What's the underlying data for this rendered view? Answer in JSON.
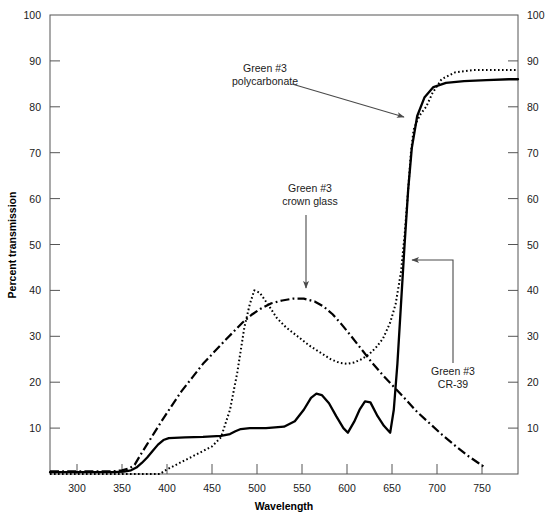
{
  "chart_data": {
    "type": "line",
    "title": "",
    "xlabel": "Wavelength",
    "ylabel": "Percent transmission",
    "xlim": [
      270,
      790
    ],
    "ylim": [
      0,
      100
    ],
    "grid": false,
    "legend_position": "none",
    "x_ticks": [
      300,
      350,
      400,
      450,
      500,
      550,
      600,
      650,
      700,
      750
    ],
    "y_ticks": [
      0,
      10,
      20,
      30,
      40,
      50,
      60,
      70,
      80,
      90,
      100
    ],
    "y_ticks_right": [
      0,
      10,
      20,
      30,
      40,
      50,
      60,
      70,
      80,
      90,
      100
    ],
    "series": [
      {
        "name": "Green #3 polycarbonate",
        "style": "dotted",
        "color": "#000000",
        "x": [
          270,
          330,
          360,
          380,
          392,
          400,
          410,
          420,
          430,
          440,
          450,
          460,
          470,
          478,
          486,
          492,
          497,
          503,
          512,
          522,
          532,
          545,
          558,
          570,
          582,
          592,
          600,
          608,
          616,
          624,
          632,
          640,
          648,
          654,
          660,
          664,
          668,
          671,
          674,
          678,
          682,
          688,
          695,
          705,
          720,
          740,
          760,
          780,
          790
        ],
        "y": [
          0,
          0,
          0,
          0,
          0,
          1,
          2,
          3,
          4,
          5,
          6,
          8,
          14,
          22,
          32,
          37,
          40,
          39.5,
          37,
          34,
          32,
          30,
          28,
          26.5,
          25,
          24.2,
          24,
          24.3,
          25,
          26,
          27.5,
          29.5,
          33,
          37,
          44,
          52,
          62,
          70,
          75,
          77,
          78.5,
          80,
          83,
          86,
          87.5,
          88,
          88,
          88,
          88
        ]
      },
      {
        "name": "Green #3 crown glass",
        "style": "dashdot",
        "color": "#000000",
        "x": [
          270,
          320,
          340,
          350,
          358,
          364,
          370,
          378,
          386,
          394,
          404,
          416,
          428,
          440,
          452,
          464,
          474,
          484,
          494,
          504,
          516,
          528,
          540,
          552,
          564,
          574,
          584,
          594,
          604,
          616,
          628,
          640,
          652,
          664,
          678,
          692,
          706,
          720,
          734,
          746,
          752
        ],
        "y": [
          0.6,
          0.6,
          0.6,
          0.8,
          1.2,
          2,
          4,
          6.5,
          9,
          11.5,
          14.5,
          18,
          21,
          24,
          26.5,
          29,
          31,
          33,
          34.7,
          36,
          37.2,
          37.8,
          38.2,
          38.2,
          37.6,
          36.5,
          34.8,
          32.6,
          30.2,
          27.2,
          24.2,
          21.5,
          19,
          16.5,
          13.5,
          11,
          8.5,
          6.2,
          4,
          2.4,
          1.6
        ]
      },
      {
        "name": "Green #3 CR-39",
        "style": "solid",
        "color": "#000000",
        "x": [
          270,
          340,
          352,
          360,
          366,
          372,
          378,
          384,
          390,
          396,
          402,
          420,
          440,
          460,
          470,
          476,
          482,
          492,
          510,
          530,
          542,
          552,
          560,
          566,
          572,
          580,
          588,
          596,
          601,
          608,
          614,
          620,
          626,
          634,
          641,
          648,
          652,
          656,
          660,
          664,
          668,
          672,
          678,
          686,
          696,
          710,
          730,
          755,
          780,
          790
        ],
        "y": [
          0.4,
          0.4,
          0.5,
          0.8,
          1.4,
          2.4,
          3.6,
          5,
          6.4,
          7.4,
          7.8,
          8,
          8.1,
          8.3,
          8.7,
          9.3,
          9.8,
          10,
          10,
          10.3,
          11.5,
          14,
          16.6,
          17.5,
          17.2,
          15.4,
          12.6,
          10,
          9,
          11.4,
          14,
          15.8,
          15.6,
          12.6,
          10.5,
          9,
          14,
          24,
          37,
          50,
          62,
          71,
          78,
          82,
          84.3,
          85.2,
          85.6,
          85.8,
          86,
          86
        ]
      }
    ],
    "annotations": [
      {
        "id": "polycarbonate",
        "lines": [
          "Green #3",
          "polycarbonate"
        ],
        "text_x": 265,
        "text_y": 72,
        "arrow": {
          "type": "diagonal",
          "x1": 292,
          "y1": 84,
          "x2": 404,
          "y2": 117
        }
      },
      {
        "id": "crown-glass",
        "lines": [
          "Green #3",
          "crown glass"
        ],
        "text_x": 310,
        "text_y": 192,
        "arrow": {
          "type": "vertical",
          "x1": 306,
          "y1": 215,
          "x2": 306,
          "y2": 288
        }
      },
      {
        "id": "cr-39",
        "lines": [
          "Green #3",
          "CR-39"
        ],
        "text_x": 453,
        "text_y": 375,
        "arrow": {
          "type": "elbow",
          "x1": 453,
          "y1": 363,
          "x2": 453,
          "y2": 260,
          "x3": 412,
          "y3": 260
        }
      }
    ]
  }
}
